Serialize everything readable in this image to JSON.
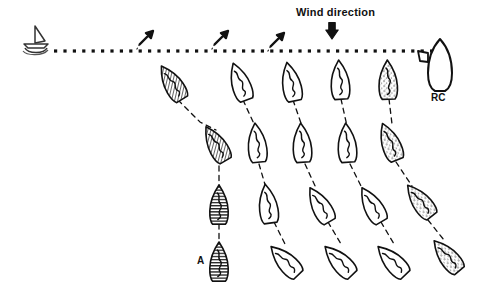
{
  "figure": {
    "background_color": "#ffffff",
    "ink_color": "#111111",
    "width": 479,
    "height": 290
  },
  "labels": {
    "wind_direction": "Wind direction",
    "race_committee": "RC",
    "boat_a": "A"
  },
  "start_line": {
    "name": "start-line",
    "style": "square-dotted",
    "y": 51,
    "x_start": 54,
    "x_end": 432,
    "dot_size": 3.2,
    "dot_gap": 6.2,
    "color": "#111111"
  },
  "pin_mark": {
    "name": "pin-end-mark-boat",
    "x": 36,
    "y": 45,
    "description": "small committee/pin boat with triangular sail at port end of line"
  },
  "committee_boat": {
    "name": "race-committee-boat",
    "x": 440,
    "y": 65,
    "description": "large upright white hull at starboard end of line, labelled RC"
  },
  "wind_arrow": {
    "name": "wind-direction-arrow",
    "x": 332,
    "y": 30,
    "direction": "down",
    "color": "#111111"
  },
  "gust_arrows": [
    {
      "name": "gust-arrow-1",
      "x": 146,
      "y": 38,
      "angle": 225
    },
    {
      "name": "gust-arrow-2",
      "x": 221,
      "y": 38,
      "angle": 225
    },
    {
      "name": "gust-arrow-3",
      "x": 277,
      "y": 40,
      "angle": 225
    }
  ],
  "fleet": {
    "columns": [
      {
        "id": "A",
        "fill": "hatch-diagonal",
        "label": "A"
      },
      {
        "id": "B",
        "fill": "white"
      },
      {
        "id": "C",
        "fill": "white"
      },
      {
        "id": "D",
        "fill": "white"
      },
      {
        "id": "E",
        "fill": "stipple"
      }
    ],
    "rows": 4,
    "boats": [
      {
        "col": "A",
        "row": 1,
        "x": 172,
        "y": 83,
        "rot": -32,
        "scale": 1.0,
        "fill": "hatch-diagonal"
      },
      {
        "col": "B",
        "row": 1,
        "x": 240,
        "y": 82,
        "rot": -20,
        "scale": 1.0,
        "fill": "white"
      },
      {
        "col": "C",
        "row": 1,
        "x": 291,
        "y": 82,
        "rot": -12,
        "scale": 1.0,
        "fill": "white"
      },
      {
        "col": "D",
        "row": 1,
        "x": 340,
        "y": 80,
        "rot": -4,
        "scale": 1.0,
        "fill": "white"
      },
      {
        "col": "E",
        "row": 1,
        "x": 388,
        "y": 80,
        "rot": -2,
        "scale": 1.0,
        "fill": "stipple"
      },
      {
        "col": "A",
        "row": 2,
        "x": 216,
        "y": 144,
        "rot": -30,
        "scale": 1.0,
        "fill": "hatch-diagonal"
      },
      {
        "col": "B",
        "row": 2,
        "x": 257,
        "y": 143,
        "rot": -6,
        "scale": 1.0,
        "fill": "white"
      },
      {
        "col": "C",
        "row": 2,
        "x": 302,
        "y": 143,
        "rot": -4,
        "scale": 1.0,
        "fill": "white"
      },
      {
        "col": "D",
        "row": 2,
        "x": 347,
        "y": 143,
        "rot": -4,
        "scale": 1.0,
        "fill": "white"
      },
      {
        "col": "E",
        "row": 2,
        "x": 390,
        "y": 142,
        "rot": -22,
        "scale": 1.0,
        "fill": "stipple"
      },
      {
        "col": "A",
        "row": 3,
        "x": 219,
        "y": 205,
        "rot": 0,
        "scale": 1.0,
        "fill": "hatch-horizontal"
      },
      {
        "col": "B",
        "row": 3,
        "x": 268,
        "y": 204,
        "rot": -8,
        "scale": 1.0,
        "fill": "white"
      },
      {
        "col": "C",
        "row": 3,
        "x": 320,
        "y": 205,
        "rot": -30,
        "scale": 1.0,
        "fill": "white"
      },
      {
        "col": "D",
        "row": 3,
        "x": 372,
        "y": 205,
        "rot": -30,
        "scale": 1.0,
        "fill": "white"
      },
      {
        "col": "E",
        "row": 3,
        "x": 420,
        "y": 201,
        "rot": -38,
        "scale": 1.0,
        "fill": "stipple"
      },
      {
        "col": "A",
        "row": 4,
        "x": 219,
        "y": 262,
        "rot": 0,
        "scale": 1.0,
        "fill": "hatch-horizontal"
      },
      {
        "col": "B",
        "row": 4,
        "x": 285,
        "y": 261,
        "rot": -44,
        "scale": 1.0,
        "fill": "white"
      },
      {
        "col": "C",
        "row": 4,
        "x": 339,
        "y": 261,
        "rot": -44,
        "scale": 1.0,
        "fill": "white"
      },
      {
        "col": "D",
        "row": 4,
        "x": 392,
        "y": 261,
        "rot": -44,
        "scale": 1.0,
        "fill": "white"
      },
      {
        "col": "E",
        "row": 4,
        "x": 447,
        "y": 256,
        "rot": -40,
        "scale": 1.0,
        "fill": "stipple"
      }
    ],
    "tracks": [
      {
        "name": "track-A",
        "points": "178,100 200,122 216,130"
      },
      {
        "name": "track-A2",
        "points": "219,166 219,188"
      },
      {
        "name": "track-A3",
        "points": "219,224 219,246"
      },
      {
        "name": "track-B",
        "points": "243,100 255,126"
      },
      {
        "name": "track-B2",
        "points": "259,164 266,188"
      },
      {
        "name": "track-B3",
        "points": "274,222 285,244"
      },
      {
        "name": "track-C",
        "points": "293,100 302,126"
      },
      {
        "name": "track-C2",
        "points": "305,164 316,188"
      },
      {
        "name": "track-C3",
        "points": "328,222 341,244"
      },
      {
        "name": "track-D",
        "points": "341,99 347,126"
      },
      {
        "name": "track-D2",
        "points": "350,164 362,188"
      },
      {
        "name": "track-D3",
        "points": "381,222 394,244"
      },
      {
        "name": "track-E",
        "points": "389,99 392,124"
      },
      {
        "name": "track-E2",
        "points": "396,162 412,186"
      },
      {
        "name": "track-E3",
        "points": "428,220 444,240"
      }
    ]
  }
}
